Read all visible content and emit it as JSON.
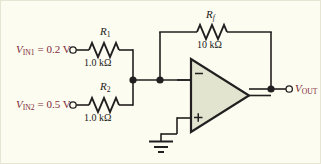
{
  "figure": {
    "kind": "circuit-schematic",
    "name": "summing-amplifier",
    "background_color": "#fdfcf0",
    "wire_color": "#231f20",
    "opamp_fill": "#e3e4cf",
    "opamp_stroke": "#231f20",
    "label_color_voltage": "#7d2b3a",
    "label_color_value": "#1a1a1a"
  },
  "inputs": [
    {
      "id": "in1",
      "symbol": "V",
      "subscript": "IN1",
      "equals": " = 0.2 V",
      "full_text": "VIN1 = 0.2 V",
      "resistor_name": "R",
      "resistor_subscript": "1",
      "resistor_value": "1.0 kΩ"
    },
    {
      "id": "in2",
      "symbol": "V",
      "subscript": "IN2",
      "equals": " = 0.5 V",
      "full_text": "VIN2 = 0.5 V",
      "resistor_name": "R",
      "resistor_subscript": "2",
      "resistor_value": "1.0 kΩ"
    }
  ],
  "feedback": {
    "resistor_name": "R",
    "resistor_subscript": "f",
    "resistor_value": "10 kΩ"
  },
  "opamp": {
    "inverting_symbol": "−",
    "noninverting_symbol": "+"
  },
  "output": {
    "symbol": "V",
    "subscript": "OUT",
    "full_text": "VOUT"
  },
  "ground": {
    "label": ""
  }
}
